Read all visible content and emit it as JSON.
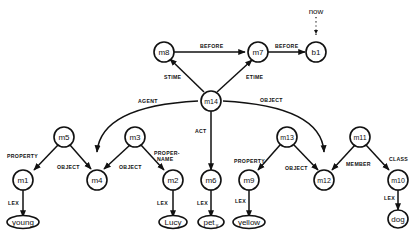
{
  "diagram": {
    "type": "semantic-network",
    "nodes": [
      {
        "id": "m8",
        "label": "m8"
      },
      {
        "id": "m7",
        "label": "m7"
      },
      {
        "id": "b1",
        "label": "b1"
      },
      {
        "id": "m14",
        "label": "m14"
      },
      {
        "id": "m5",
        "label": "m5"
      },
      {
        "id": "m3",
        "label": "m3"
      },
      {
        "id": "m1",
        "label": "m1"
      },
      {
        "id": "m4",
        "label": "m4"
      },
      {
        "id": "m2",
        "label": "m2"
      },
      {
        "id": "m6",
        "label": "m6"
      },
      {
        "id": "m13",
        "label": "m13"
      },
      {
        "id": "m9",
        "label": "m9"
      },
      {
        "id": "m12",
        "label": "m12"
      },
      {
        "id": "m11",
        "label": "m11"
      },
      {
        "id": "m10",
        "label": "m10"
      },
      {
        "id": "young",
        "label": "young"
      },
      {
        "id": "Lucy",
        "label": "Lucy"
      },
      {
        "id": "pet",
        "label": "pet",
        "subscript": "v"
      },
      {
        "id": "yellow",
        "label": "yellow"
      },
      {
        "id": "dog",
        "label": "dog"
      },
      {
        "id": "now",
        "label": "now"
      }
    ],
    "edges": [
      {
        "from": "m8",
        "to": "m7",
        "label": "BEFORE"
      },
      {
        "from": "m7",
        "to": "b1",
        "label": "BEFORE"
      },
      {
        "from": "now",
        "to": "b1",
        "label": "",
        "style": "dotted"
      },
      {
        "from": "m14",
        "to": "m8",
        "label": "STIME"
      },
      {
        "from": "m14",
        "to": "m7",
        "label": "ETIME"
      },
      {
        "from": "m14",
        "to": "m4",
        "label": "AGENT"
      },
      {
        "from": "m14",
        "to": "m12",
        "label": "OBJECT"
      },
      {
        "from": "m14",
        "to": "m6",
        "label": "ACT"
      },
      {
        "from": "m5",
        "to": "m1",
        "label": "PROPERTY"
      },
      {
        "from": "m5",
        "to": "m4",
        "label": "OBJECT"
      },
      {
        "from": "m3",
        "to": "m4",
        "label": "OBJECT"
      },
      {
        "from": "m3",
        "to": "m2",
        "label": "PROPER-NAME"
      },
      {
        "from": "m1",
        "to": "young",
        "label": "LEX"
      },
      {
        "from": "m2",
        "to": "Lucy",
        "label": "LEX"
      },
      {
        "from": "m6",
        "to": "pet",
        "label": "LEX"
      },
      {
        "from": "m13",
        "to": "m9",
        "label": "PROPERTY"
      },
      {
        "from": "m13",
        "to": "m12",
        "label": "OBJECT"
      },
      {
        "from": "m9",
        "to": "yellow",
        "label": "LEX"
      },
      {
        "from": "m11",
        "to": "m12",
        "label": "MEMBER"
      },
      {
        "from": "m11",
        "to": "m10",
        "label": "CLASS"
      },
      {
        "from": "m10",
        "to": "dog",
        "label": "LEX"
      }
    ],
    "edge_labels": {
      "before1": "BEFORE",
      "before2": "BEFORE",
      "stime": "STIME",
      "etime": "ETIME",
      "agent": "AGENT",
      "object_m14": "OBJECT",
      "act": "ACT",
      "property_m5": "PROPERTY",
      "object_m5": "OBJECT",
      "object_m3": "OBJECT",
      "propername_1": "PROPER-",
      "propername_2": "NAME",
      "lex_m1": "LEX",
      "lex_m2": "LEX",
      "lex_m6": "LEX",
      "property_m13": "PROPERTY",
      "object_m13": "OBJECT",
      "lex_m9": "LEX",
      "member": "MEMBER",
      "class": "CLASS",
      "lex_m10": "LEX"
    },
    "labels": {
      "m8": "m8",
      "m7": "m7",
      "b1": "b1",
      "m14": "m14",
      "m5": "m5",
      "m3": "m3",
      "m1": "m1",
      "m4": "m4",
      "m2": "m2",
      "m6": "m6",
      "m13": "m13",
      "m9": "m9",
      "m12": "m12",
      "m11": "m11",
      "m10": "m10",
      "young": "young",
      "Lucy": "Lucy",
      "pet": "pet",
      "pet_sub": "v",
      "yellow": "yellow",
      "dog": "dog",
      "now": "now"
    }
  }
}
